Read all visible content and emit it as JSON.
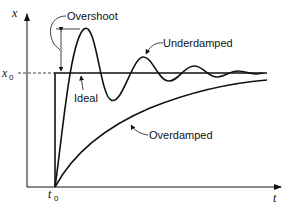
{
  "diagram": {
    "type": "step-response",
    "axes": {
      "y_label": "x",
      "x_label": "t",
      "y_marker": {
        "symbol": "x",
        "subscript": "0"
      },
      "x_marker": {
        "symbol": "t",
        "subscript": "0"
      }
    },
    "curves": [
      {
        "name": "Ideal",
        "label": "Ideal",
        "description": "step from 0 to x0 at t0"
      },
      {
        "name": "Underdamped",
        "label": "Underdamped",
        "description": "oscillates about x0 with decaying amplitude"
      },
      {
        "name": "Overdamped",
        "label": "Overdamped",
        "description": "rises slowly toward x0 without overshoot"
      }
    ],
    "annotations": [
      {
        "label": "Overshoot",
        "description": "distance from x0 to first underdamped peak"
      }
    ],
    "colors": {
      "line": "#111111",
      "background": "#ffffff"
    }
  }
}
